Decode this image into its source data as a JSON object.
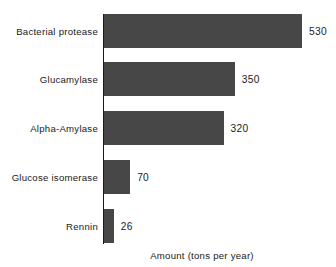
{
  "chart_data": {
    "type": "bar",
    "orientation": "horizontal",
    "title": "",
    "subtitle": "",
    "xlabel": "Amount (tons per year)",
    "ylabel": "",
    "categories": [
      "Bacterial protease",
      "Glucamylase",
      "Alpha-Amylase",
      "Glucose isomerase",
      "Rennin"
    ],
    "values": [
      530,
      350,
      320,
      70,
      26
    ],
    "value_labels": [
      "530",
      "350",
      "320",
      "70",
      "26"
    ],
    "xlim": [
      0,
      530
    ],
    "grid": false,
    "legend": null,
    "bars": [
      {
        "category": "Bacterial protease",
        "value": 530,
        "label": "530"
      },
      {
        "category": "Glucamylase",
        "value": 350,
        "label": "350"
      },
      {
        "category": "Alpha-Amylase",
        "value": 320,
        "label": "320"
      },
      {
        "category": "Glucose isomerase",
        "value": 70,
        "label": "70"
      },
      {
        "category": "Rennin",
        "value": 26,
        "label": "26"
      }
    ]
  },
  "style": {
    "bar_color": "#474747",
    "axis_color": "#1a1a1a",
    "text_color": "#1a1a1a",
    "background": "#ffffff"
  }
}
